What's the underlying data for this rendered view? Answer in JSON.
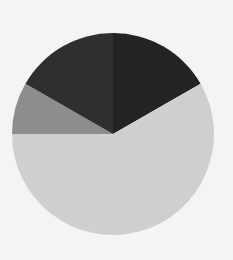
{
  "chart_data": {
    "type": "pie",
    "title": "",
    "legend": [],
    "start_angle_deg": 0,
    "direction": "clockwise",
    "center": [
      113,
      134
    ],
    "radius": 101,
    "slices": [
      {
        "name": "slice-1",
        "value": 16.7,
        "color": "#232323"
      },
      {
        "name": "slice-2",
        "value": 58.3,
        "color": "#cfcfce"
      },
      {
        "name": "slice-3",
        "value": 8.3,
        "color": "#8d8d8c"
      },
      {
        "name": "slice-4",
        "value": 16.7,
        "color": "#2f2f2f"
      }
    ]
  },
  "background": "#f4f4f3"
}
